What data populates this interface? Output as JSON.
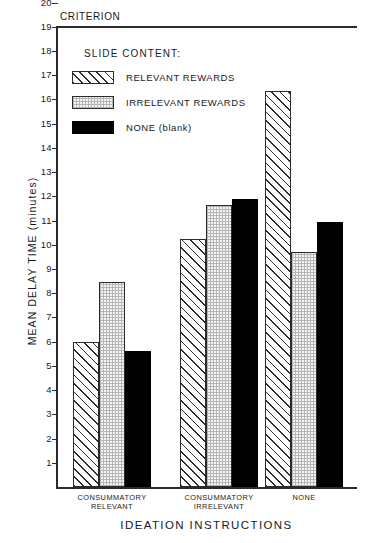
{
  "chart_data": {
    "type": "bar",
    "title": "",
    "xlabel": "IDEATION INSTRUCTIONS",
    "ylabel": "MEAN DELAY TIME (minutes)",
    "ylim": [
      0,
      20
    ],
    "ytick_labels": [
      "20",
      "19",
      "18",
      "17",
      "16",
      "15",
      "14",
      "13",
      "12",
      "11",
      "10",
      "9",
      "8",
      "7",
      "6",
      "5",
      "4",
      "3",
      "2",
      "1"
    ],
    "grid": false,
    "legend_position": "upper-left-inside",
    "legend_title": "SLIDE CONTENT:",
    "criterion_label": "CRITERION",
    "criterion_value": 20,
    "categories": [
      "CONSUMMATORY\nRELEVANT",
      "CONSUMMATORY\nIRRELEVANT",
      "NONE"
    ],
    "series": [
      {
        "name": "RELEVANT REWARDS",
        "pattern": "diagonal-hatch",
        "values": [
          6.0,
          10.25,
          16.35
        ]
      },
      {
        "name": "IRRELEVANT REWARDS",
        "pattern": "dotted-grid",
        "values": [
          8.45,
          11.65,
          9.7
        ]
      },
      {
        "name": "NONE (blank)",
        "pattern": "solid-black",
        "values": [
          5.6,
          11.9,
          10.95
        ]
      }
    ]
  },
  "colors": {
    "ink": "#2b2b2b",
    "solid_fill": "#000000",
    "background": "#ffffff"
  }
}
